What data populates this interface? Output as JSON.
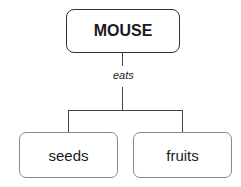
{
  "root": {
    "label": "MOUSE"
  },
  "relation": {
    "label": "eats"
  },
  "children": [
    {
      "label": "seeds"
    },
    {
      "label": "fruits"
    }
  ]
}
